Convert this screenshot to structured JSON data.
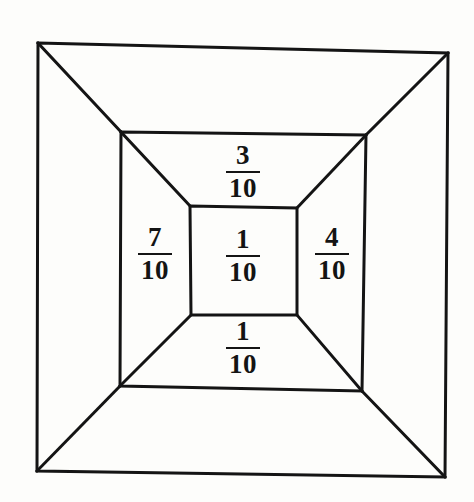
{
  "figure": {
    "background_color": "#fdfdfb",
    "stroke_color": "#141414",
    "stroke_width": 3,
    "canvas": {
      "width": 474,
      "height": 502
    },
    "squares": [
      {
        "name": "outer-square",
        "points": "38,43 448,53 445,477 37,471"
      },
      {
        "name": "middle-square",
        "points": "121,132 366,135 362,391 120,386"
      },
      {
        "name": "inner-square",
        "points": "190,206 297,208 297,315 191,315"
      }
    ],
    "diagonals": [
      {
        "name": "diagonal-outer-top-left",
        "x1": 38,
        "y1": 43,
        "x2": 121,
        "y2": 132
      },
      {
        "name": "diagonal-outer-top-right",
        "x1": 448,
        "y1": 53,
        "x2": 366,
        "y2": 135
      },
      {
        "name": "diagonal-outer-bottom-right",
        "x1": 445,
        "y1": 477,
        "x2": 362,
        "y2": 391
      },
      {
        "name": "diagonal-outer-bottom-left",
        "x1": 37,
        "y1": 471,
        "x2": 120,
        "y2": 386
      },
      {
        "name": "diagonal-middle-top-left",
        "x1": 121,
        "y1": 132,
        "x2": 190,
        "y2": 206
      },
      {
        "name": "diagonal-middle-top-right",
        "x1": 366,
        "y1": 135,
        "x2": 297,
        "y2": 208
      },
      {
        "name": "diagonal-middle-bottom-right",
        "x1": 362,
        "y1": 391,
        "x2": 297,
        "y2": 315
      },
      {
        "name": "diagonal-middle-bottom-left",
        "x1": 120,
        "y1": 386,
        "x2": 191,
        "y2": 315
      }
    ]
  },
  "labels": {
    "top": {
      "numerator": "3",
      "denominator": "10",
      "region": "middle-band-top"
    },
    "left": {
      "numerator": "7",
      "denominator": "10",
      "region": "middle-band-left"
    },
    "center": {
      "numerator": "1",
      "denominator": "10",
      "region": "inner-square"
    },
    "right": {
      "numerator": "4",
      "denominator": "10",
      "region": "middle-band-right"
    },
    "bottom": {
      "numerator": "1",
      "denominator": "10",
      "region": "middle-band-bottom"
    }
  },
  "chart_data": {
    "type": "diagram",
    "categories": [
      "top",
      "left",
      "center",
      "right",
      "bottom"
    ],
    "values": [
      0.3,
      0.7,
      0.1,
      0.4,
      0.1
    ],
    "value_labels": [
      "3/10",
      "7/10",
      "1/10",
      "4/10",
      "1/10"
    ],
    "denominator": 10,
    "numerators": [
      3,
      7,
      1,
      4,
      1
    ],
    "xlabel": "",
    "ylabel": "",
    "grid": false,
    "legend": "none"
  }
}
